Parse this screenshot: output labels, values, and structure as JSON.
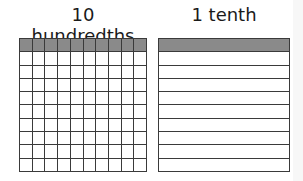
{
  "left_panel": {
    "title": "10 hundredths",
    "rows": 10,
    "cols": 10,
    "shaded_rows": [
      0
    ],
    "shaded_count": 10
  },
  "right_panel": {
    "title": "1 tenth",
    "rows": 10,
    "cols": 1,
    "shaded_rows": [
      0
    ],
    "shaded_count": 1
  },
  "colors": {
    "shaded": "#8a8a8a",
    "grid_line": "#3a3a3a",
    "background": "#ffffff"
  }
}
